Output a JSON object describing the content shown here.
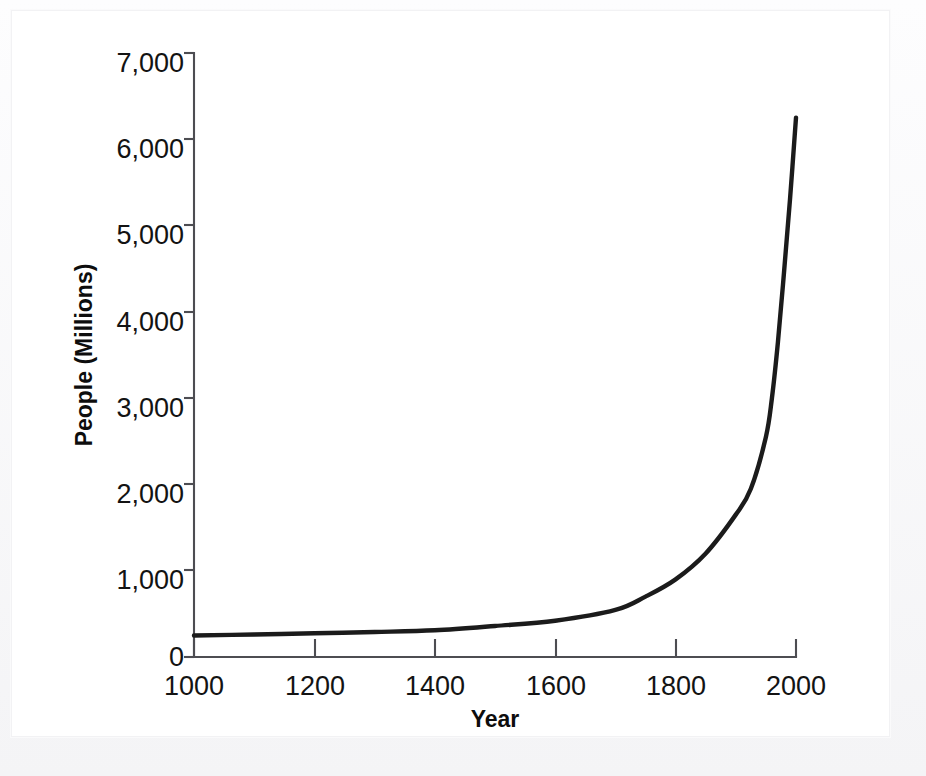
{
  "figure": {
    "background_color": "#ffffff",
    "page_background_color": "#fbfbfc",
    "curve_color": "#1b1b1b",
    "axis_color": "#4d4d52"
  },
  "chart_data": {
    "type": "line",
    "title": "",
    "xlabel": "Year",
    "ylabel": "People (Millions)",
    "xlim": [
      1000,
      2000
    ],
    "ylim": [
      0,
      7000
    ],
    "grid": false,
    "legend": "none",
    "x_ticks": [
      1000,
      1200,
      1400,
      1600,
      1800,
      2000
    ],
    "x_tick_labels": [
      "1000",
      "1200",
      "1400",
      "1600",
      "1800",
      "2000"
    ],
    "y_ticks": [
      0,
      1000,
      2000,
      3000,
      4000,
      5000,
      6000,
      7000
    ],
    "y_tick_labels": [
      "0",
      "1,000",
      "2,000",
      "3,000",
      "4,000",
      "5,000",
      "6,000",
      "7,000"
    ],
    "series": [
      {
        "name": "World population",
        "x": [
          1000,
          1100,
          1200,
          1300,
          1400,
          1500,
          1600,
          1700,
          1750,
          1800,
          1850,
          1900,
          1925,
          1950,
          1960,
          1970,
          1980,
          1990,
          2000
        ],
        "values": [
          250,
          260,
          275,
          290,
          310,
          360,
          420,
          545,
          700,
          900,
          1200,
          1650,
          1950,
          2550,
          3000,
          3650,
          4450,
          5300,
          6250
        ]
      }
    ]
  },
  "axis_labels": {
    "y_title": "People (Millions)",
    "x_title": "Year",
    "y_0": "0",
    "y_1000": "1,000",
    "y_2000": "2,000",
    "y_3000": "3,000",
    "y_4000": "4,000",
    "y_5000": "5,000",
    "y_6000": "6,000",
    "y_7000": "7,000",
    "x_1000": "1000",
    "x_1200": "1200",
    "x_1400": "1400",
    "x_1600": "1600",
    "x_1800": "1800",
    "x_2000": "2000"
  }
}
